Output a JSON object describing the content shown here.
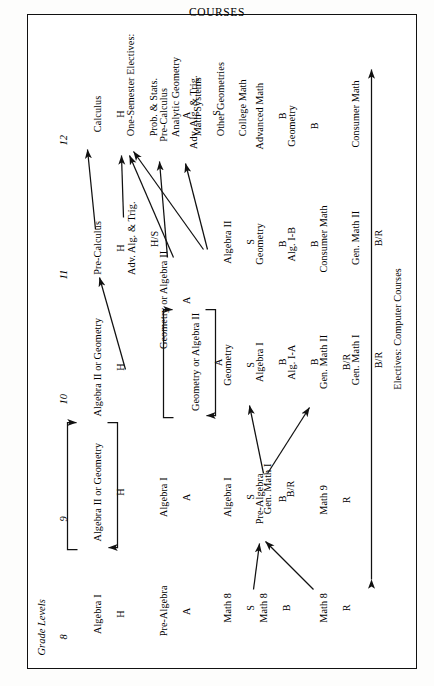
{
  "title": "COURSES",
  "grade_levels_label": "Grade Levels",
  "grades": {
    "g8": "8",
    "g9": "9",
    "g10": "10",
    "g11": "11",
    "g12": "12"
  },
  "tracks": [
    {
      "name": "honors-track",
      "courses": [
        {
          "grade": "8",
          "name": "Algebra I",
          "level": "H"
        },
        {
          "grade": "9",
          "name": "Algebra II or Geometry",
          "level": "H"
        },
        {
          "grade": "10",
          "name": "Algebra II or Geometry",
          "level": "H"
        },
        {
          "grade": "11",
          "name": "Pre-Calculus",
          "level": "H"
        },
        {
          "grade": "12",
          "name": "Calculus",
          "level": "H"
        }
      ]
    },
    {
      "name": "accelerated-track",
      "courses": [
        {
          "grade": "8",
          "name": "Pre-Algebra",
          "level": "A"
        },
        {
          "grade": "9",
          "name": "Algebra I",
          "level": "A"
        },
        {
          "grade": "10",
          "name": "Geometry or Algebra II",
          "level": "A"
        },
        {
          "grade": "11",
          "name": "Geometry or Algebra II",
          "level": "A"
        },
        {
          "grade": "11",
          "name": "Adv. Alg. & Trig.",
          "level": "H/S"
        },
        {
          "grade": "12",
          "name": "Pre-Calculus",
          "level": "A"
        }
      ]
    },
    {
      "name": "standard-track",
      "courses": [
        {
          "grade": "8",
          "name": "Math 8",
          "level": "S"
        },
        {
          "grade": "9",
          "name": "Algebra I",
          "level": "S"
        },
        {
          "grade": "10",
          "name": "Geometry",
          "level": "S"
        },
        {
          "grade": "11",
          "name": "Algebra II",
          "level": "S"
        },
        {
          "grade": "12",
          "name": "Adv. Alg. & Trig.",
          "level": "S"
        }
      ]
    },
    {
      "name": "basic-track",
      "courses": [
        {
          "grade": "8",
          "name": "Math 8",
          "level": "B"
        },
        {
          "grade": "9",
          "name": "Pre-Algebra",
          "level": "B"
        },
        {
          "grade": "10",
          "name": "Algebra I",
          "level": "B"
        },
        {
          "grade": "11",
          "name": "Geometry",
          "level": "B"
        },
        {
          "grade": "12",
          "name": "Advanced Math",
          "level": "B"
        }
      ]
    },
    {
      "name": "basic-alt-track",
      "courses": [
        {
          "grade": "10",
          "name": "Alg. I-A",
          "level": "B"
        },
        {
          "grade": "11",
          "name": "Alg. I-B",
          "level": "B"
        },
        {
          "grade": "12",
          "name": "Geometry",
          "level": "B"
        }
      ]
    },
    {
      "name": "remedial-track",
      "courses": [
        {
          "grade": "8",
          "name": "Math 8",
          "level": "R"
        },
        {
          "grade": "9",
          "name": "Math 9",
          "level": "R"
        },
        {
          "grade": "10",
          "name": "Gen. Math I",
          "level": "B/R"
        },
        {
          "grade": "11",
          "name": "Gen. Math II",
          "level": "B/R"
        }
      ]
    }
  ],
  "nodes": {
    "g8_algebra1_h": {
      "name": "Algebra I",
      "level": "H"
    },
    "g9_alg2geo_h": {
      "name": "Algebra II or Geometry",
      "level": "H"
    },
    "g10_alg2geo_h": {
      "name": "Algebra II or Geometry",
      "level": "H"
    },
    "g11_precalc_h": {
      "name": "Pre-Calculus",
      "level": "H"
    },
    "g12_calculus_h": {
      "name": "Calculus",
      "level": "H"
    },
    "g8_prealgebra_a": {
      "name": "Pre-Algebra",
      "level": "A"
    },
    "g9_algebra1_a": {
      "name": "Algebra I",
      "level": "A"
    },
    "g10_geoalg2_a": {
      "name": "Geometry or Algebra II",
      "level": "A"
    },
    "g11_geoalg2_a": {
      "name": "Geometry or Algebra II",
      "level": "A"
    },
    "g11_advalg_hs": {
      "name": "Adv. Alg. & Trig.",
      "level": "H/S"
    },
    "g12_precalc_a": {
      "name": "Pre-Calculus",
      "level": "A"
    },
    "g8_math8_s": {
      "name": "Math 8",
      "level": "S"
    },
    "g9_algebra1_s": {
      "name": "Algebra I",
      "level": "S"
    },
    "g10_geometry_s": {
      "name": "Geometry",
      "level": "S"
    },
    "g11_algebra2_s": {
      "name": "Algebra II",
      "level": "S"
    },
    "g12_advalg_s": {
      "name": "Adv. Alg. & Trig.",
      "level": "S"
    },
    "g8_math8_b": {
      "name": "Math 8",
      "level": "B"
    },
    "g9_prealgebra_b": {
      "name": "Pre-Algebra",
      "level": "B"
    },
    "g10_algebra1_b": {
      "name": "Algebra I",
      "level": "B"
    },
    "g10_alg1a_b": {
      "name": "Alg. I-A",
      "level": "B"
    },
    "g11_geometry_b": {
      "name": "Geometry",
      "level": "B"
    },
    "g11_alg1b_b": {
      "name": "Alg. I-B",
      "level": "B"
    },
    "g11_consumer_b": {
      "name": "Consumer Math",
      "level": ""
    },
    "g12_advmath_b": {
      "name": "Advanced Math",
      "level": "B"
    },
    "g12_geometry_b": {
      "name": "Geometry",
      "level": "B"
    },
    "g12_consumer": {
      "name": "Consumer Math",
      "level": ""
    },
    "g8_math8_r": {
      "name": "Math 8",
      "level": "R"
    },
    "g9_math9_r": {
      "name": "Math 9",
      "level": "R"
    },
    "g9_genmath1_br": {
      "name": "Gen. Math I",
      "level": "B/R"
    },
    "g10_genmath2_br": {
      "name": "Gen. Math II",
      "level": "B/R"
    },
    "g10_genmath1_br": {
      "name": "Gen. Math I",
      "level": "B/R"
    },
    "g11_genmath2_br": {
      "name": "Gen. Math II",
      "level": "B/R"
    }
  },
  "electives_block": {
    "heading": "One-Semester Electives:",
    "items": [
      "Prob. & Stats.",
      "Analytic Geometry",
      "Math Systems",
      "Other Geometries",
      "College Math"
    ]
  },
  "electives_footer": {
    "line1": "Electives: Computer Courses",
    "line2": "Liberal Arts Math"
  },
  "colors": {
    "ink": "#111111",
    "paper": "#ffffff"
  }
}
